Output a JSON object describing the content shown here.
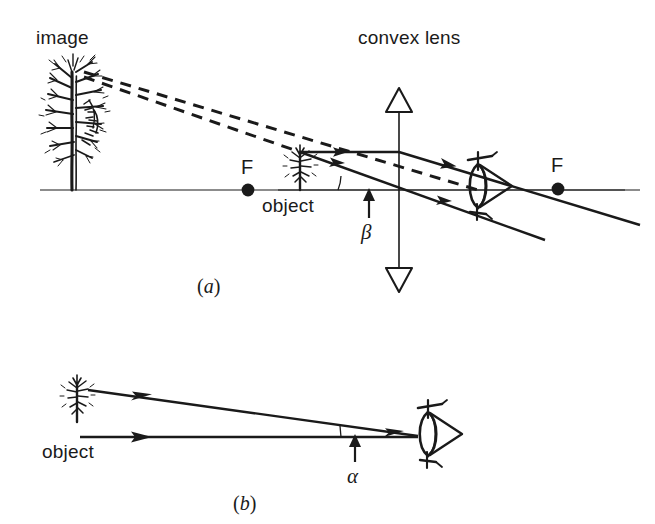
{
  "figure": {
    "title_not_shown": "",
    "background_color": "#ffffff",
    "ink_color": "#1a1a1a",
    "width": 655,
    "height": 524
  },
  "panel_a": {
    "caption_open": "(",
    "caption_letter": "a",
    "caption_close": ")",
    "labels": {
      "image": "image",
      "convex_lens": "convex lens",
      "object": "object",
      "focal_left": "F",
      "focal_right": "F",
      "angle": "β"
    },
    "elements": {
      "optical_axis": "horizontal principal axis",
      "lens_axis": "vertical lens plane with hollow arrowheads",
      "image_tree": "large bare tree (virtual image)",
      "object_tree": "small tree (object)",
      "eye": "eye symbol viewing through lens",
      "dashed_rays": 2,
      "solid_rays": 2
    }
  },
  "panel_b": {
    "caption_open": "(",
    "caption_letter": "b",
    "caption_close": ")",
    "labels": {
      "object": "object",
      "angle": "α"
    },
    "elements": {
      "object_tree": "small tree (object)",
      "eye": "eye symbol viewing directly",
      "solid_rays": 2
    }
  },
  "geometry": {
    "axis_y_a": 190,
    "lens_x": 399,
    "focal_left_x": 248,
    "focal_right_x": 558,
    "axis_y_b": 418
  }
}
